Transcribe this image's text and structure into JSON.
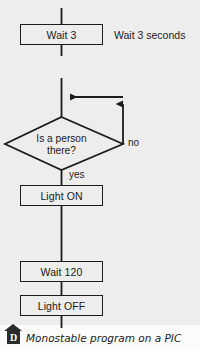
{
  "diagram": {
    "title_caption": "Monostable program on a PIC",
    "caption_badge": "D",
    "nodes": {
      "wait3": "Wait 3",
      "decision_line1": "Is a person",
      "decision_line2": "there?",
      "light_on": "Light ON",
      "wait120": "Wait 120",
      "light_off": "Light OFF"
    },
    "annotations": {
      "wait3_note": "Wait 3 seconds"
    },
    "branch_labels": {
      "no": "no",
      "yes": "yes"
    },
    "colors": {
      "background": "#ededed",
      "stroke": "#1c1c1c",
      "text": "#1a1a1a",
      "badge": "#2b2b2b",
      "caption_band": "#fbfbfb"
    },
    "icons": {
      "arrow_up": "arrow-up-icon",
      "arrow_left": "arrow-left-icon",
      "roof": "roof-marker-icon"
    }
  }
}
